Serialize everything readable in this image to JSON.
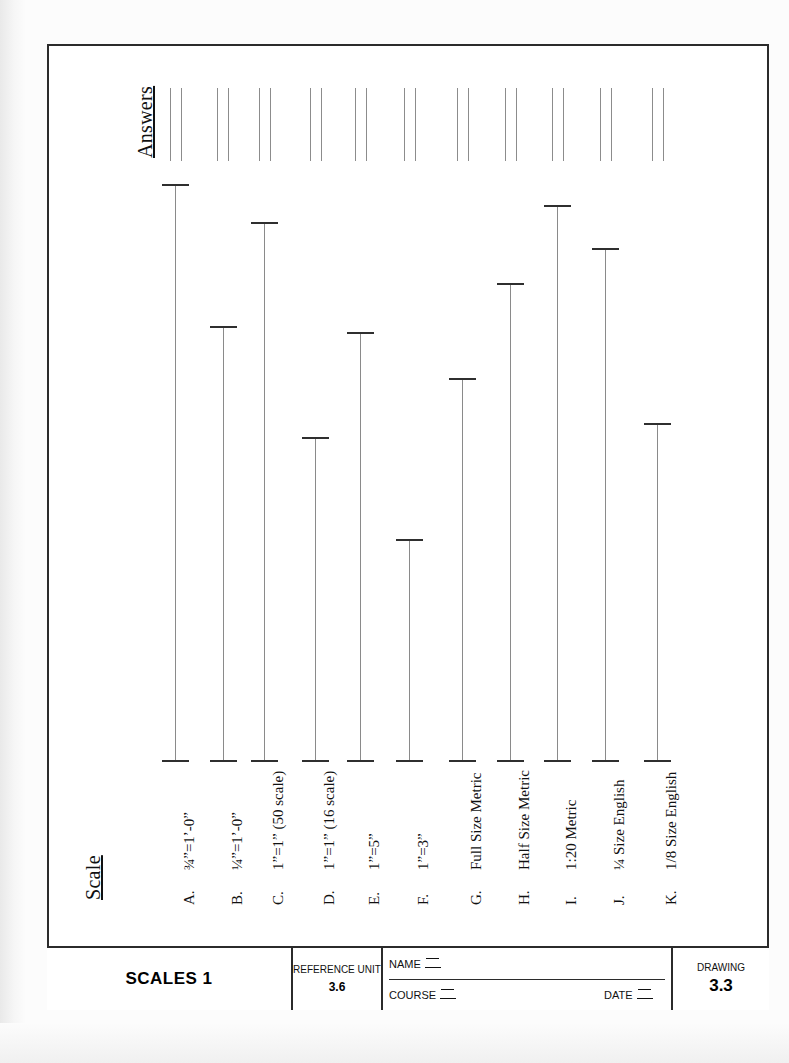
{
  "document": {
    "headings": {
      "answers": "Answers",
      "scale": "Scale"
    }
  },
  "rows": [
    {
      "letter": "A.",
      "name": "¾”=1’-0”",
      "x": 175,
      "top": 184,
      "bottom": 760
    },
    {
      "letter": "B.",
      "name": "¼”=1’-0”",
      "x": 223,
      "top": 326,
      "bottom": 760
    },
    {
      "letter": "C.",
      "name": "1”=1” (50 scale)",
      "x": 264,
      "top": 222,
      "bottom": 760
    },
    {
      "letter": "D.",
      "name": "1”=1”  (16 scale)",
      "x": 315,
      "top": 437,
      "bottom": 760
    },
    {
      "letter": "E.",
      "name": "1”=5”",
      "x": 360,
      "top": 332,
      "bottom": 760
    },
    {
      "letter": "F.",
      "name": "1”=3”",
      "x": 409,
      "top": 539,
      "bottom": 760
    },
    {
      "letter": "G.",
      "name": "Full Size Metric",
      "x": 462,
      "top": 378,
      "bottom": 760
    },
    {
      "letter": "H.",
      "name": "Half Size Metric",
      "x": 510,
      "top": 283,
      "bottom": 760
    },
    {
      "letter": "I.",
      "name": "1:20 Metric",
      "x": 557,
      "top": 205,
      "bottom": 760
    },
    {
      "letter": "J.",
      "name": "¼ Size English",
      "x": 605,
      "top": 248,
      "bottom": 760
    },
    {
      "letter": "K.",
      "name": "1/8 Size English",
      "x": 657,
      "top": 423,
      "bottom": 760
    }
  ],
  "answer_slots": [
    {
      "x": 170
    },
    {
      "x": 217
    },
    {
      "x": 259
    },
    {
      "x": 310
    },
    {
      "x": 355
    },
    {
      "x": 404
    },
    {
      "x": 457
    },
    {
      "x": 505
    },
    {
      "x": 552
    },
    {
      "x": 600
    },
    {
      "x": 652
    }
  ],
  "title_block": {
    "title": "SCALES 1",
    "reference_unit_label": "REFERENCE UNIT",
    "reference_unit_value": "3.6",
    "name_label": "NAME",
    "course_label": "COURSE",
    "date_label": "DATE",
    "drawing_label": "DRAWING",
    "drawing_value": "3.3"
  },
  "colors": {
    "ink": "#2b2b2b",
    "line": "#8a8a8a",
    "paper": "#ffffff"
  }
}
